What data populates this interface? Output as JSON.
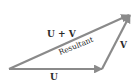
{
  "diagram": {
    "colors": {
      "arrow": "#8a8a8a",
      "text": "#2a2a2a",
      "background": "#ffffff"
    },
    "vectors": [
      {
        "id": "U",
        "label": "U",
        "from": [
          9,
          69
        ],
        "to": [
          102,
          69
        ]
      },
      {
        "id": "V",
        "label": "V",
        "from": [
          102,
          69
        ],
        "to": [
          130,
          14
        ]
      },
      {
        "id": "resultant",
        "label": "U + V",
        "from": [
          9,
          69
        ],
        "to": [
          130,
          14
        ]
      }
    ],
    "labels": {
      "u": "U",
      "v": "V",
      "sum": "U + V",
      "resultant": "Resultant"
    }
  }
}
